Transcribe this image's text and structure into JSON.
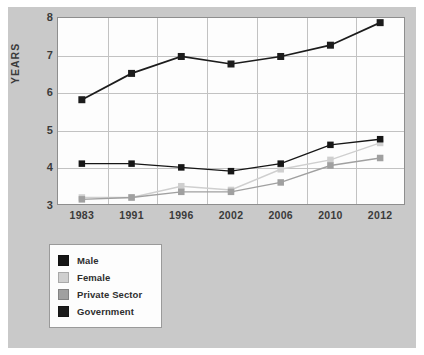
{
  "chart_data": {
    "type": "line",
    "title": "",
    "xlabel": "",
    "ylabel": "YEARS",
    "categories": [
      "1983",
      "1991",
      "1996",
      "2002",
      "2006",
      "2010",
      "2012"
    ],
    "ylim": [
      3,
      8
    ],
    "yticks": [
      "3",
      "4",
      "5",
      "6",
      "7",
      "8"
    ],
    "grid": true,
    "legend_position": "below-left",
    "series": [
      {
        "name": "Male",
        "color": "#161616",
        "marker": "square",
        "values": [
          4.1,
          4.1,
          4.0,
          3.9,
          4.1,
          4.6,
          4.75
        ]
      },
      {
        "name": "Female",
        "color": "#cfcfcf",
        "marker": "square",
        "values": [
          3.2,
          3.2,
          3.5,
          3.4,
          3.95,
          4.2,
          4.65
        ]
      },
      {
        "name": "Private Sector",
        "color": "#a0a0a0",
        "marker": "square",
        "values": [
          3.15,
          3.2,
          3.35,
          3.35,
          3.6,
          4.05,
          4.25
        ]
      },
      {
        "name": "Government",
        "color": "#1c1c1c",
        "marker": "square",
        "values": [
          5.8,
          6.5,
          6.95,
          6.75,
          6.95,
          7.25,
          7.85
        ]
      }
    ]
  },
  "legend": {
    "items": [
      {
        "label": "Male",
        "color": "#161616"
      },
      {
        "label": "Female",
        "color": "#cfcfcf"
      },
      {
        "label": "Private Sector",
        "color": "#a0a0a0"
      },
      {
        "label": "Government",
        "color": "#1c1c1c"
      }
    ]
  },
  "colors": {
    "figure_background": "#c9c9c9",
    "plot_background": "#fdfdfd",
    "grid": "#c2c2c2",
    "axis_text": "#3b3b3b",
    "frame": "#8e8e8e"
  }
}
